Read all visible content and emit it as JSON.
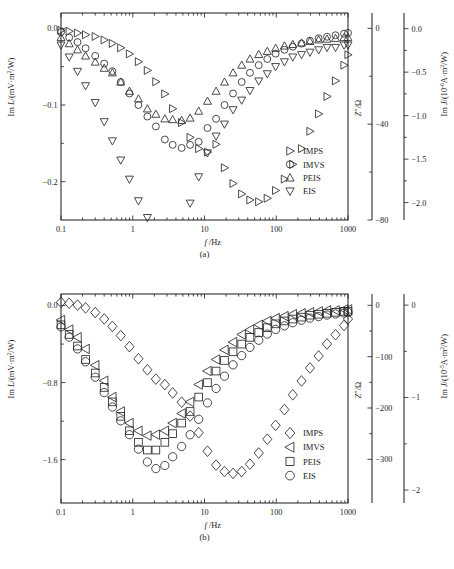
{
  "figure": {
    "type": "scatter"
  },
  "panels": [
    {
      "id": "a",
      "panel_label": "(a)",
      "xlabel": "f /Hz",
      "xlabel_italic": "f",
      "xlabel_rest": "/Hz",
      "xscale": "log",
      "xlim": [
        0.1,
        1000
      ],
      "xticks": [
        "0.1",
        "1",
        "10",
        "100",
        "1000"
      ],
      "xtick_values": [
        0.1,
        1,
        10,
        100,
        1000
      ],
      "left_axis": {
        "label_parts": [
          "Im ",
          "L",
          "/(mV·m",
          "2",
          "/W)"
        ],
        "label": "Im L/(mV·m2/W)",
        "ticks": [
          "0.0",
          "-0.1",
          "-0.2"
        ],
        "tick_values": [
          0.0,
          -0.1,
          -0.2
        ],
        "lim": [
          -0.25,
          0.02
        ]
      },
      "right_axis_inner": {
        "label": "Z″/Ω",
        "ticks": [
          "0",
          "-40",
          "-80"
        ],
        "tick_values": [
          0,
          -40,
          -80
        ],
        "lim": [
          -80,
          6.4
        ]
      },
      "right_axis_outer": {
        "label": "Im J/(10-6A·m2/W)",
        "label_parts": [
          "Im ",
          "J",
          "/(10",
          "-6",
          "A·m",
          "2",
          "/W)"
        ],
        "ticks": [
          "0.0",
          "-0.5",
          "-1.0",
          "-1.5",
          "-2.0"
        ],
        "tick_values": [
          0.0,
          -0.5,
          -1.0,
          -1.5,
          -2.0
        ],
        "lim": [
          -2.2,
          0.18
        ]
      },
      "legend": [
        {
          "label": "IMPS",
          "marker": "triangle-right"
        },
        {
          "label": "IMVS",
          "marker": "circle"
        },
        {
          "label": "PEIS",
          "marker": "triangle-up"
        },
        {
          "label": "EIS",
          "marker": "triangle-down"
        }
      ],
      "series": [
        {
          "name": "IMPS",
          "marker": "triangle-right",
          "axis": "right_axis_outer",
          "x": [
            0.1,
            0.13,
            0.17,
            0.22,
            0.3,
            0.4,
            0.52,
            0.68,
            0.9,
            1.2,
            1.6,
            2.1,
            2.8,
            3.6,
            4.8,
            6.3,
            8.3,
            11,
            14.5,
            19,
            25,
            33,
            43,
            57,
            75,
            98,
            130,
            170,
            225,
            295,
            390,
            510,
            670,
            880,
            1000
          ],
          "y": [
            -0.02,
            -0.03,
            -0.05,
            -0.07,
            -0.09,
            -0.13,
            -0.17,
            -0.22,
            -0.29,
            -0.38,
            -0.48,
            -0.61,
            -0.75,
            -0.92,
            -1.08,
            -1.25,
            -1.38,
            -1.42,
            -1.33,
            -1.6,
            -1.78,
            -1.9,
            -1.97,
            -1.99,
            -1.95,
            -1.86,
            -1.73,
            -1.56,
            -1.38,
            -1.18,
            -0.98,
            -0.78,
            -0.6,
            -0.42,
            -0.3
          ]
        },
        {
          "name": "IMVS",
          "marker": "circle",
          "axis": "left_axis",
          "x": [
            0.1,
            0.13,
            0.17,
            0.22,
            0.3,
            0.4,
            0.52,
            0.68,
            0.9,
            1.2,
            1.6,
            2.1,
            2.8,
            3.6,
            4.8,
            6.3,
            8.3,
            11,
            14.5,
            19,
            25,
            33,
            43,
            57,
            75,
            98,
            130,
            170,
            225,
            295,
            390,
            510,
            670,
            880,
            1000
          ],
          "y": [
            -0.005,
            -0.012,
            -0.018,
            -0.026,
            -0.036,
            -0.046,
            -0.056,
            -0.07,
            -0.085,
            -0.1,
            -0.115,
            -0.128,
            -0.145,
            -0.152,
            -0.156,
            -0.152,
            -0.148,
            -0.13,
            -0.118,
            -0.1,
            -0.085,
            -0.07,
            -0.058,
            -0.048,
            -0.04,
            -0.033,
            -0.028,
            -0.024,
            -0.02,
            -0.016,
            -0.013,
            -0.011,
            -0.009,
            -0.007,
            -0.006
          ]
        },
        {
          "name": "PEIS",
          "marker": "triangle-up",
          "axis": "left_axis",
          "x": [
            0.1,
            0.13,
            0.17,
            0.22,
            0.3,
            0.4,
            0.52,
            0.68,
            0.9,
            1.2,
            1.6,
            2.1,
            2.8,
            3.6,
            4.8,
            6.3,
            8.3,
            11,
            14.5,
            19,
            25,
            33,
            43,
            57,
            75,
            98,
            130,
            170,
            225,
            295,
            390,
            510,
            670,
            880,
            1000
          ],
          "y": [
            -0.012,
            -0.02,
            -0.028,
            -0.036,
            -0.044,
            -0.052,
            -0.058,
            -0.07,
            -0.082,
            -0.092,
            -0.105,
            -0.112,
            -0.118,
            -0.119,
            -0.12,
            -0.117,
            -0.108,
            -0.095,
            -0.082,
            -0.07,
            -0.058,
            -0.048,
            -0.04,
            -0.034,
            -0.03,
            -0.026,
            -0.023,
            -0.021,
            -0.019,
            -0.017,
            -0.015,
            -0.014,
            -0.013,
            -0.012,
            -0.012
          ]
        },
        {
          "name": "EIS",
          "marker": "triangle-down",
          "axis": "right_axis_inner",
          "x": [
            0.1,
            0.13,
            0.17,
            0.22,
            0.3,
            0.4,
            0.52,
            0.68,
            0.9,
            1.2,
            1.6,
            2.1,
            2.8,
            3.6,
            4.8,
            6.3,
            8.3,
            11,
            14.5,
            19,
            25,
            33,
            43,
            57,
            75,
            98,
            130,
            170,
            225,
            295,
            390,
            510,
            670,
            880,
            1000
          ],
          "y": [
            -7,
            -12,
            -18,
            -24,
            -31,
            -39,
            -47,
            -55,
            -63,
            -72,
            -79,
            -86,
            -90,
            -90,
            -85,
            -73,
            -62,
            -52,
            -45,
            -40,
            -34,
            -30,
            -26,
            -22,
            -19,
            -16,
            -14,
            -12,
            -11,
            -10,
            -9,
            -8,
            -8,
            -7,
            -7
          ]
        }
      ]
    },
    {
      "id": "b",
      "panel_label": "(b)",
      "xlabel": "f /Hz",
      "xlabel_italic": "f",
      "xlabel_rest": "/Hz",
      "xscale": "log",
      "xlim": [
        0.1,
        1000
      ],
      "xticks": [
        "0.1",
        "1",
        "10",
        "100",
        "1000"
      ],
      "xtick_values": [
        0.1,
        1,
        10,
        100,
        1000
      ],
      "left_axis": {
        "label_parts": [
          "Im ",
          "L",
          "/(mV·m",
          "2",
          "/W)"
        ],
        "label": "Im L/(mV·m2/W)",
        "ticks": [
          "0.0",
          "-0.8",
          "-1.6"
        ],
        "tick_values": [
          0.0,
          -0.8,
          -1.6
        ],
        "lim": [
          -2.05,
          0.12
        ]
      },
      "right_axis_inner": {
        "label": "Z″/Ω",
        "ticks": [
          "0",
          "-100",
          "-200",
          "-300"
        ],
        "tick_values": [
          0,
          -100,
          -200,
          -300
        ],
        "lim": [
          -385,
          22
        ]
      },
      "right_axis_outer": {
        "label": "Im J/(10-5A·m2/W)",
        "label_parts": [
          "Im ",
          "J",
          "/(10",
          "-5",
          "A·m",
          "2",
          "/W)"
        ],
        "ticks": [
          "0",
          "-1",
          "-2"
        ],
        "tick_values": [
          0,
          -1,
          -2
        ],
        "lim": [
          -2.14,
          0.12
        ]
      },
      "legend": [
        {
          "label": "IMPS",
          "marker": "diamond"
        },
        {
          "label": "IMVS",
          "marker": "triangle-left"
        },
        {
          "label": "PEIS",
          "marker": "square"
        },
        {
          "label": "EIS",
          "marker": "circle"
        }
      ],
      "series": [
        {
          "name": "IMPS",
          "marker": "diamond",
          "axis": "right_axis_outer",
          "x": [
            0.1,
            0.13,
            0.17,
            0.22,
            0.3,
            0.4,
            0.52,
            0.68,
            0.9,
            1.2,
            1.6,
            2.1,
            2.8,
            3.6,
            4.8,
            6.3,
            8.3,
            11,
            14.5,
            19,
            25,
            33,
            43,
            57,
            75,
            98,
            130,
            170,
            225,
            295,
            390,
            510,
            670,
            880,
            1000
          ],
          "y": [
            0.03,
            0.02,
            0.0,
            -0.03,
            -0.08,
            -0.15,
            -0.23,
            -0.33,
            -0.45,
            -0.58,
            -0.7,
            -0.8,
            -0.86,
            -0.95,
            -1.05,
            -1.2,
            -1.38,
            -1.58,
            -1.73,
            -1.8,
            -1.82,
            -1.8,
            -1.72,
            -1.6,
            -1.45,
            -1.3,
            -1.13,
            -0.97,
            -0.82,
            -0.68,
            -0.55,
            -0.42,
            -0.32,
            -0.22,
            -0.15
          ]
        },
        {
          "name": "IMVS",
          "marker": "triangle-left",
          "axis": "left_axis",
          "x": [
            0.1,
            0.13,
            0.17,
            0.22,
            0.3,
            0.4,
            0.52,
            0.68,
            0.9,
            1.2,
            1.6,
            2.1,
            2.8,
            3.6,
            4.8,
            6.3,
            8.3,
            11,
            14.5,
            19,
            25,
            33,
            43,
            57,
            75,
            98,
            130,
            170,
            225,
            295,
            390,
            510,
            670,
            880,
            1000
          ],
          "y": [
            -0.15,
            -0.25,
            -0.33,
            -0.45,
            -0.62,
            -0.78,
            -0.95,
            -1.1,
            -1.22,
            -1.3,
            -1.35,
            -1.34,
            -1.3,
            -1.22,
            -1.12,
            -1.0,
            -0.82,
            -0.68,
            -0.56,
            -0.46,
            -0.38,
            -0.3,
            -0.25,
            -0.2,
            -0.16,
            -0.13,
            -0.11,
            -0.09,
            -0.08,
            -0.07,
            -0.06,
            -0.05,
            -0.05,
            -0.04,
            -0.04
          ]
        },
        {
          "name": "PEIS",
          "marker": "square",
          "axis": "left_axis",
          "x": [
            0.1,
            0.13,
            0.17,
            0.22,
            0.3,
            0.4,
            0.52,
            0.68,
            0.9,
            1.2,
            1.6,
            2.1,
            2.8,
            3.6,
            4.8,
            6.3,
            8.3,
            11,
            14.5,
            19,
            25,
            33,
            43,
            57,
            75,
            98,
            130,
            170,
            225,
            295,
            390,
            510,
            670,
            880,
            1000
          ],
          "y": [
            -0.2,
            -0.3,
            -0.42,
            -0.56,
            -0.7,
            -0.85,
            -1.0,
            -1.15,
            -1.3,
            -1.42,
            -1.5,
            -1.5,
            -1.42,
            -1.33,
            -1.22,
            -1.1,
            -0.95,
            -0.8,
            -0.68,
            -0.57,
            -0.48,
            -0.4,
            -0.33,
            -0.28,
            -0.23,
            -0.19,
            -0.16,
            -0.14,
            -0.12,
            -0.1,
            -0.09,
            -0.08,
            -0.07,
            -0.06,
            -0.06
          ]
        },
        {
          "name": "EIS",
          "marker": "circle",
          "axis": "right_axis_inner",
          "x": [
            0.1,
            0.13,
            0.17,
            0.22,
            0.3,
            0.4,
            0.52,
            0.68,
            0.9,
            1.2,
            1.6,
            2.1,
            2.8,
            3.6,
            4.8,
            6.3,
            8.3,
            11,
            14.5,
            19,
            25,
            33,
            43,
            57,
            75,
            98,
            130,
            170,
            225,
            295,
            390,
            510,
            670,
            880,
            1000
          ],
          "y": [
            -42,
            -62,
            -85,
            -110,
            -140,
            -170,
            -198,
            -225,
            -252,
            -280,
            -305,
            -318,
            -312,
            -295,
            -275,
            -252,
            -222,
            -190,
            -162,
            -138,
            -116,
            -98,
            -82,
            -68,
            -56,
            -47,
            -40,
            -34,
            -29,
            -25,
            -22,
            -19,
            -17,
            -15,
            -14
          ]
        }
      ]
    }
  ]
}
